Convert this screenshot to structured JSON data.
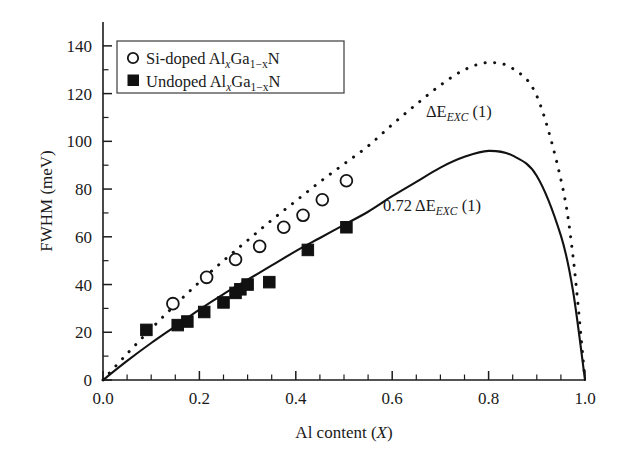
{
  "chart_data": {
    "type": "scatter",
    "title": "",
    "xlabel": "Al content (X)",
    "ylabel": "FWHM (meV)",
    "xlim": [
      0.0,
      1.0
    ],
    "ylim": [
      0,
      150
    ],
    "xticks": [
      0.0,
      0.2,
      0.4,
      0.6,
      0.8,
      1.0
    ],
    "xticklabels": [
      "0.0",
      "0.2",
      "0.4",
      "0.6",
      "0.8",
      "1.0"
    ],
    "xminor_step": 0.05,
    "yticks": [
      0,
      20,
      40,
      60,
      80,
      100,
      120,
      140
    ],
    "yticklabels": [
      "0",
      "20",
      "40",
      "60",
      "80",
      "100",
      "120",
      "140"
    ],
    "yminor_step": 10,
    "grid": false,
    "legend_position": "upper-left",
    "series": [
      {
        "name": "Si-doped Al(x)Ga(1-x)N",
        "marker": "open-circle",
        "x": [
          0.145,
          0.215,
          0.275,
          0.325,
          0.375,
          0.415,
          0.455,
          0.505
        ],
        "y": [
          32.0,
          43.0,
          50.5,
          56.0,
          64.0,
          69.0,
          75.5,
          83.5
        ]
      },
      {
        "name": "Undoped Al(x)Ga(1-x)N",
        "marker": "filled-square",
        "x": [
          0.09,
          0.155,
          0.175,
          0.21,
          0.25,
          0.275,
          0.285,
          0.3,
          0.345,
          0.425,
          0.505
        ],
        "y": [
          21.0,
          23.0,
          24.5,
          28.5,
          32.5,
          36.5,
          38.0,
          40.0,
          41.0,
          54.5,
          64.0
        ]
      }
    ],
    "curves": [
      {
        "name": "delta-E-exc-1",
        "style": "dotted",
        "label": "ΔE",
        "label_sub": "EXC",
        "label_tail": " (1)",
        "peak_x": 0.795,
        "peak_y": 133,
        "points_x": [
          0.0,
          0.05,
          0.1,
          0.15,
          0.2,
          0.25,
          0.3,
          0.35,
          0.4,
          0.45,
          0.5,
          0.55,
          0.6,
          0.65,
          0.7,
          0.75,
          0.8,
          0.85,
          0.9,
          0.95,
          0.975,
          1.0
        ],
        "points_y": [
          0.0,
          11.0,
          21.5,
          31.5,
          41.0,
          50.0,
          58.5,
          67.0,
          75.0,
          83.0,
          90.5,
          98.0,
          107.0,
          115.5,
          123.5,
          130.0,
          133.0,
          130.5,
          119.0,
          84.0,
          52.0,
          0.0
        ]
      },
      {
        "name": "0.72-delta-E-exc-1",
        "style": "solid",
        "label": "0.72 ΔE",
        "label_sub": "EXC",
        "label_tail": " (1)",
        "peak_x": 0.79,
        "peak_y": 96,
        "points_x": [
          0.0,
          0.05,
          0.1,
          0.15,
          0.2,
          0.25,
          0.3,
          0.35,
          0.4,
          0.45,
          0.5,
          0.55,
          0.6,
          0.65,
          0.7,
          0.75,
          0.8,
          0.85,
          0.9,
          0.95,
          0.975,
          1.0
        ],
        "points_y": [
          0.0,
          8.0,
          15.5,
          22.5,
          29.5,
          36.0,
          42.0,
          48.0,
          54.0,
          59.5,
          65.0,
          70.5,
          77.0,
          83.0,
          89.0,
          93.5,
          96.0,
          94.0,
          85.5,
          60.5,
          37.5,
          0.0
        ]
      }
    ]
  },
  "axes": {
    "ylabel": "FWHM (meV)",
    "xlabel_pre": "Al content (",
    "xlabel_var": "X",
    "xlabel_post": ")",
    "xticklabels": [
      "0.0",
      "0.2",
      "0.4",
      "0.6",
      "0.8",
      "1.0"
    ],
    "yticklabels": [
      "0",
      "20",
      "40",
      "60",
      "80",
      "100",
      "120",
      "140"
    ]
  },
  "legend": {
    "entries": [
      {
        "marker": "open-circle",
        "prefix": "Si-doped Al",
        "sub1": "x",
        "mid": "Ga",
        "sub2": "1−x",
        "suffix": "N"
      },
      {
        "marker": "filled-square",
        "prefix": "Undoped Al",
        "sub1": "x",
        "mid": "Ga",
        "sub2": "1−x",
        "suffix": "N"
      }
    ]
  },
  "annotations": [
    {
      "name": "dotted-curve-label",
      "prefix": "ΔE",
      "sub": "EXC",
      "suffix": " (1)"
    },
    {
      "name": "solid-curve-label",
      "prefix": "0.72 ΔE",
      "sub": "EXC",
      "suffix": " (1)"
    }
  ]
}
